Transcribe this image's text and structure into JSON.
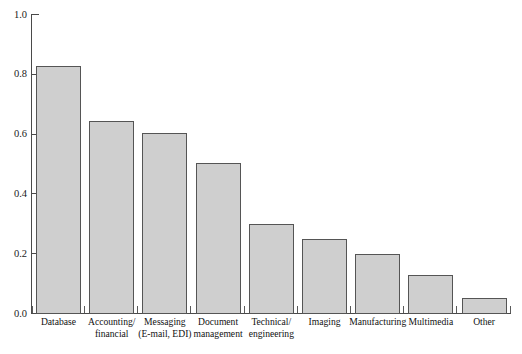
{
  "chart_data": {
    "type": "bar",
    "title": "",
    "subtitle": "",
    "xlabel": "",
    "ylabel": "",
    "ylim": [
      0.0,
      1.0
    ],
    "grid": false,
    "legend": null,
    "ytick_labels": [
      "1.0",
      "0.8",
      "0.6",
      "0.4",
      "0.2",
      "0.0"
    ],
    "ytick_values": [
      1.0,
      0.8,
      0.6,
      0.4,
      0.2,
      0.0
    ],
    "categories": [
      "Database",
      "Accounting/ financial",
      "Messaging (E-mail, EDI)",
      "Document management",
      "Technical/ engineering",
      "Imaging",
      "Manufacturing",
      "Multimedia",
      "Other"
    ],
    "category_lines": [
      [
        "Database",
        ""
      ],
      [
        "Accounting/",
        "financial"
      ],
      [
        "Messaging",
        "(E-mail, EDI)"
      ],
      [
        "Document",
        "management"
      ],
      [
        "Technical/",
        "engineering"
      ],
      [
        "Imaging",
        ""
      ],
      [
        "Manufacturing",
        ""
      ],
      [
        "Multimedia",
        ""
      ],
      [
        "Other",
        ""
      ]
    ],
    "values": [
      0.83,
      0.645,
      0.605,
      0.505,
      0.3,
      0.25,
      0.2,
      0.13,
      0.055
    ],
    "bar_fill_color": "#cfcfcf",
    "bar_border_color": "#555555",
    "axis_color": "#4a4a4a",
    "background_color": "#ffffff"
  }
}
